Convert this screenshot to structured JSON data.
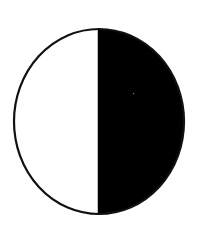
{
  "figure": {
    "shape": "half-filled-circle",
    "label": "",
    "colors": {
      "background": "#ffffff",
      "outline": "#111111",
      "left_half": "#ffffff",
      "right_half": "#000000",
      "speck": "#777777"
    },
    "geometry": {
      "cx": 99,
      "cy": 121.5,
      "rx": 85,
      "ry": 92.5,
      "divider_x": 98.5,
      "stroke_width": 2.2
    }
  }
}
